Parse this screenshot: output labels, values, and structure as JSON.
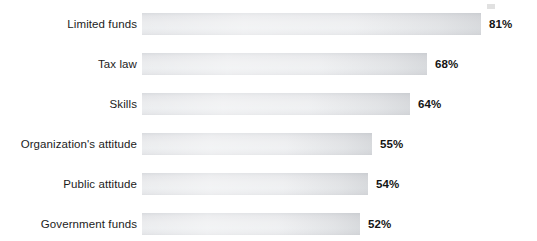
{
  "chart_data": {
    "type": "bar",
    "orientation": "horizontal",
    "title": "",
    "subtitle": "",
    "xlabel": "",
    "ylabel": "",
    "xlim": [
      0,
      100
    ],
    "grid": false,
    "legend": null,
    "value_suffix": "%",
    "categories": [
      "Limited funds",
      "Tax law",
      "Skills",
      "Organization's attitude",
      "Public attitude",
      "Government funds"
    ],
    "values": [
      81,
      68,
      64,
      55,
      54,
      52
    ],
    "value_labels": [
      "81%",
      "68%",
      "64%",
      "55%",
      "54%",
      "52%"
    ],
    "colors": {
      "bar_fill": "#eceef0",
      "bar_shade_top": "#d8dade",
      "bar_shade_edge": "#aaaeb3",
      "label_text": "#1c1c1c",
      "value_text": "#141414",
      "background": "#ffffff"
    }
  },
  "rows": [
    {
      "label": "Limited funds",
      "value": 81,
      "value_label": "81%"
    },
    {
      "label": "Tax law",
      "value": 68,
      "value_label": "68%"
    },
    {
      "label": "Skills",
      "value": 64,
      "value_label": "64%"
    },
    {
      "label": "Organization's attitude",
      "value": 55,
      "value_label": "55%"
    },
    {
      "label": "Public attitude",
      "value": 54,
      "value_label": "54%"
    },
    {
      "label": "Government funds",
      "value": 52,
      "value_label": "52%"
    }
  ],
  "layout": {
    "bar_start_x": 142,
    "px_per_percent": 4.185,
    "row_top_start": 13,
    "row_pitch": 40,
    "bar_height": 22,
    "value_gap": 8
  }
}
